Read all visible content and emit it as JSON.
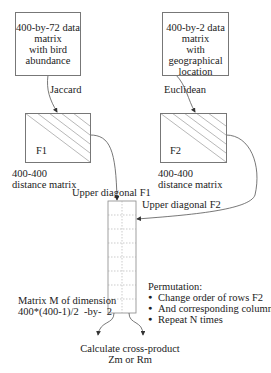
{
  "diagram": {
    "source_box_1": {
      "lines": [
        "400-by-72 data",
        "matrix",
        "with bird",
        "abundance"
      ]
    },
    "source_box_2": {
      "lines": [
        "400-by-2 data",
        "matrix",
        "with geographical",
        "location"
      ]
    },
    "edge_1_label": "Jaccard",
    "edge_2_label": "Euclidean",
    "matrix_f1": {
      "name": "F1",
      "caption_lines": [
        "400-400",
        "distance matrix"
      ]
    },
    "matrix_f2": {
      "name": "F2",
      "caption_lines": [
        "400-400",
        "distance matrix"
      ]
    },
    "edge_f1_label": "Upper diagonal F1",
    "edge_f2_label": "Upper diagonal F2",
    "matrix_m": {
      "caption_lines": [
        "Matrix M of dimension",
        "400*(400-1)/2  -by-  2"
      ],
      "columns": 2,
      "rows": 8
    },
    "permutation": {
      "title": "Permutation:",
      "bullets": [
        "Change order of rows F2",
        "And corresponding columns!",
        "Repeat N times"
      ]
    },
    "result": {
      "lines": [
        "Calculate cross-product",
        "Zm or Rm"
      ]
    },
    "colors": {
      "line": "#555555",
      "box_border": "#777777",
      "hatch": "#999999",
      "grid": "#aaaaaa"
    }
  }
}
